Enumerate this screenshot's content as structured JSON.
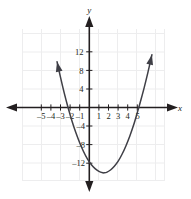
{
  "figure": {
    "kind": "coordinate-plane-parabola",
    "background_color": "#ffffff",
    "curve_color": "#3f3f46",
    "axis_color": "#231f20",
    "grid_color": "#ededee"
  },
  "axes": {
    "x_axis_label": "x",
    "y_axis_label": "y",
    "x_tick_labels": [
      "–5",
      "–4",
      "–3",
      "–2",
      "–1",
      "1",
      "2",
      "3",
      "4",
      "5"
    ],
    "x_tick_values": [
      -5,
      -4,
      -3,
      -2,
      -1,
      1,
      2,
      3,
      4,
      5
    ],
    "y_tick_labels": [
      "12",
      "8",
      "4",
      "–4",
      "–8",
      "–12"
    ],
    "y_tick_values": [
      12,
      8,
      4,
      -4,
      -8,
      -12
    ]
  },
  "chart_data": {
    "type": "line",
    "title": "",
    "xlabel": "x",
    "ylabel": "y",
    "xlim": [
      -7.2,
      8.0
    ],
    "ylim": [
      -15.7,
      16.8
    ],
    "grid": true,
    "grid_step_x": 2,
    "grid_step_y": 4,
    "legend": null,
    "series": [
      {
        "name": "parabola",
        "equation": "y = x^2 - 3.1x - 11.7",
        "color": "#3f3f46",
        "vertex": [
          1.55,
          -12.3
        ],
        "x_intercepts": [
          -2.2,
          5.3
        ],
        "y_intercept": -11.7,
        "arrowheads": [
          "start",
          "end"
        ],
        "x": [
          -3.35,
          -3.0,
          -2.6,
          -2.2,
          -1.8,
          -1.4,
          -1.0,
          -0.6,
          -0.2,
          0.2,
          0.6,
          1.0,
          1.4,
          1.55,
          1.8,
          2.2,
          2.6,
          3.0,
          3.4,
          3.8,
          4.2,
          4.6,
          5.0,
          5.3,
          5.7,
          6.1,
          6.5
        ],
        "y": [
          9.9,
          6.6,
          3.1,
          -0.05,
          -2.9,
          -5.4,
          -7.6,
          -9.5,
          -11.1,
          -12.3,
          -13.2,
          -13.8,
          -14.1,
          -14.1,
          -14.0,
          -13.5,
          -12.7,
          -11.6,
          -10.1,
          -8.3,
          -6.2,
          -3.8,
          -1.0,
          1.2,
          4.3,
          7.7,
          11.4
        ]
      }
    ]
  },
  "icons": {
    "x_axis_arrow_left": "arrow-left-icon",
    "x_axis_arrow_right": "arrow-right-icon",
    "y_axis_arrow_up": "arrow-up-icon",
    "y_axis_arrow_down": "arrow-down-icon",
    "curve_arrow_start": "arrow-up-left-icon",
    "curve_arrow_end": "arrow-up-right-icon"
  }
}
